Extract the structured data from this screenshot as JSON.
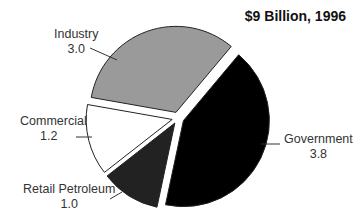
{
  "chart_data": {
    "type": "pie",
    "title": "$9 Billion, 1996",
    "unit": "billion dollars",
    "total": 9.0,
    "slices": [
      {
        "label": "Government",
        "value": 3.8,
        "color": "#000000"
      },
      {
        "label": "Retail Petroleum",
        "value": 1.0,
        "color": "#222222"
      },
      {
        "label": "Commercial",
        "value": 1.2,
        "color": "#ffffff"
      },
      {
        "label": "Industry",
        "value": 3.0,
        "color": "#9a9a9a"
      }
    ],
    "exploded": true,
    "legend": "none (direct labels with leader lines)"
  },
  "labels": {
    "industry": {
      "name": "Industry",
      "value": "3.0"
    },
    "commercial": {
      "name": "Commercial",
      "value": "1.2"
    },
    "retail": {
      "name": "Retail Petroleum",
      "value": "1.0"
    },
    "government": {
      "name": "Government",
      "value": "3.8"
    }
  }
}
